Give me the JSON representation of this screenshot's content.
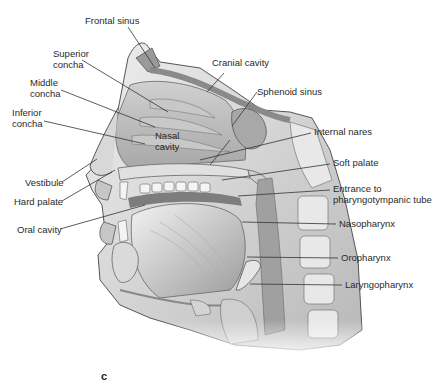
{
  "figure": {
    "panel_letter": "c"
  },
  "labels": {
    "frontal_sinus": "Frontal sinus",
    "superior_concha_1": "Superior",
    "superior_concha_2": "concha",
    "middle_concha_1": "Middle",
    "middle_concha_2": "concha",
    "inferior_concha_1": "Inferior",
    "inferior_concha_2": "concha",
    "nasal_cavity_1": "Nasal",
    "nasal_cavity_2": "cavity",
    "vestibule": "Vestibule",
    "hard_palate": "Hard palate",
    "oral_cavity": "Oral cavity",
    "cranial_cavity": "Cranial cavity",
    "sphenoid_sinus": "Sphenoid sinus",
    "internal_nares": "Internal nares",
    "soft_palate": "Soft palate",
    "entrance_1": "Entrance to",
    "entrance_2": "pharyngotympanic tube",
    "nasopharynx": "Nasopharynx",
    "oropharynx": "Oropharynx",
    "laryngopharynx": "Laryngopharynx"
  },
  "colors": {
    "line": "#333333",
    "tissue_light": "#e4e4e4",
    "tissue_mid": "#bdbdbd",
    "tissue_dark": "#8a8a8a",
    "bone": "#d8d8d8"
  }
}
